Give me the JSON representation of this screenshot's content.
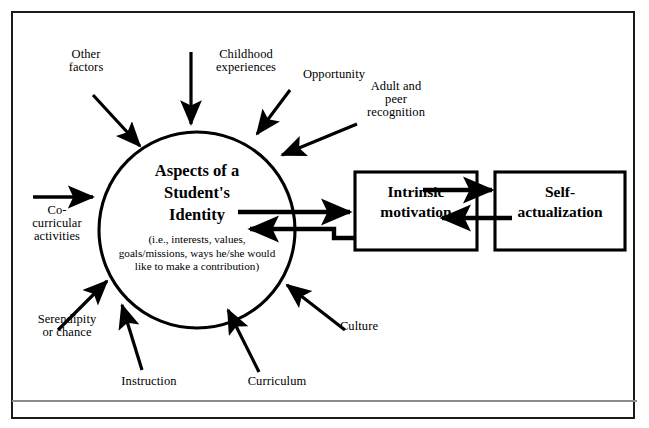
{
  "figure": {
    "type": "concept-diagram",
    "title_text": "Aspects of a Student's Identity model",
    "frame_color": "#1a1a1a",
    "rule_color": "#8a8a8a",
    "background": "#ffffff"
  },
  "center_node": {
    "name": "aspects-of-a-students-identity",
    "shape": "circle",
    "heading": "Aspects of a\nStudent's\nIdentity",
    "subtext": "(i.e., interests, values,\ngoals/missions, ways he/she would\nlike to make a contribution)"
  },
  "boxes": [
    {
      "name": "intrinsic-motivation",
      "label": "Intrinsic\nmotivation"
    },
    {
      "name": "self-actualization",
      "label": "Self-\nactualization"
    }
  ],
  "influences": [
    {
      "name": "other-factors",
      "label": "Other\nfactors"
    },
    {
      "name": "childhood-experiences",
      "label": "Childhood\nexperiences"
    },
    {
      "name": "opportunity",
      "label": "Opportunity"
    },
    {
      "name": "adult-and-peer-recognition",
      "label": "Adult and\npeer\nrecognition"
    },
    {
      "name": "co-curricular-activities",
      "label": "Co-\ncurricular\nactivities"
    },
    {
      "name": "serendipity-or-chance",
      "label": "Serendipity\nor  chance"
    },
    {
      "name": "instruction",
      "label": "Instruction"
    },
    {
      "name": "curriculum",
      "label": "Curriculum"
    },
    {
      "name": "culture",
      "label": "Culture"
    }
  ],
  "connections": [
    {
      "name": "identity-to-motivation",
      "from": "aspects-of-a-students-identity",
      "to": "intrinsic-motivation",
      "direction": "right"
    },
    {
      "name": "motivation-to-identity",
      "from": "intrinsic-motivation",
      "to": "aspects-of-a-students-identity",
      "direction": "left"
    },
    {
      "name": "motivation-to-self-actualization",
      "from": "intrinsic-motivation",
      "to": "self-actualization",
      "direction": "right"
    },
    {
      "name": "self-actualization-to-motivation",
      "from": "self-actualization",
      "to": "intrinsic-motivation",
      "direction": "left"
    }
  ]
}
